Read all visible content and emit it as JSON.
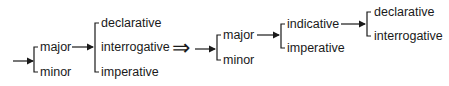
{
  "diagram": {
    "type": "system-network",
    "left": {
      "level1": [
        "major",
        "minor"
      ],
      "level2_from": "major",
      "level2": [
        "declarative",
        "interrogative",
        "imperative"
      ]
    },
    "transform_symbol": "⇒",
    "right": {
      "level1": [
        "major",
        "minor"
      ],
      "level2_from": "major",
      "level2": [
        "indicative",
        "imperative"
      ],
      "level3_from": "indicative",
      "level3": [
        "declarative",
        "interrogative"
      ]
    },
    "colors": {
      "ink": "#1a1a1a",
      "background": "#ffffff"
    }
  }
}
